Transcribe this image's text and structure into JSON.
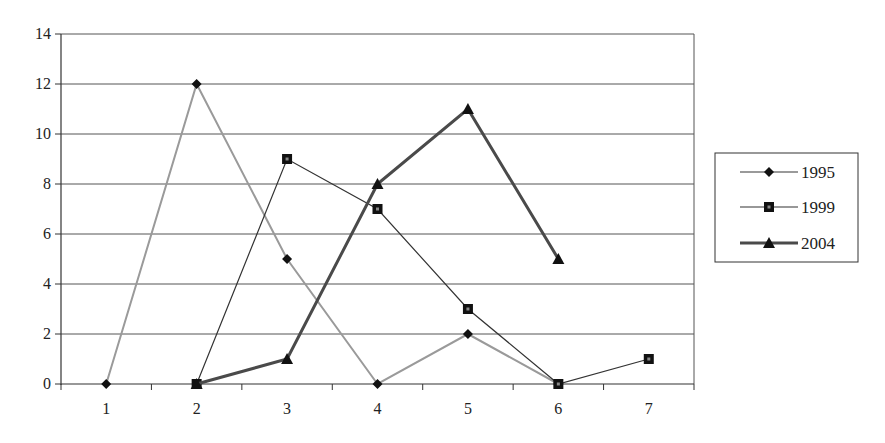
{
  "chart_data": {
    "type": "line",
    "title": "",
    "xlabel": "",
    "ylabel": "",
    "categories": [
      "1",
      "2",
      "3",
      "4",
      "5",
      "6",
      "7"
    ],
    "ylim": [
      0,
      14
    ],
    "yticks": [
      0,
      2,
      4,
      6,
      8,
      10,
      12,
      14
    ],
    "grid": true,
    "legend_position": "right",
    "series": [
      {
        "name": "1995",
        "marker": "diamond",
        "color": "#9a9a9a",
        "line_width": 2,
        "values": [
          0,
          12,
          5,
          0,
          2,
          0,
          null
        ]
      },
      {
        "name": "1999",
        "marker": "square",
        "color": "#333333",
        "line_width": 1.2,
        "values": [
          null,
          0,
          9,
          7,
          3,
          0,
          1
        ]
      },
      {
        "name": "2004",
        "marker": "triangle",
        "color": "#4a4a4a",
        "line_width": 3,
        "values": [
          null,
          0,
          1,
          8,
          11,
          5,
          null
        ]
      }
    ]
  },
  "legend": {
    "items": [
      {
        "label": "1995"
      },
      {
        "label": "1999"
      },
      {
        "label": "2004"
      }
    ]
  }
}
